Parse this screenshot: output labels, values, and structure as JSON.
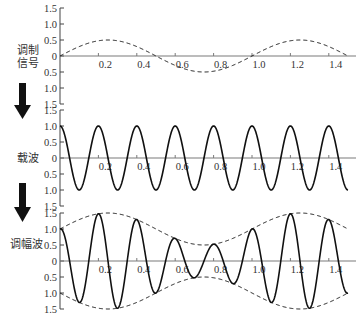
{
  "chart_data": [
    {
      "type": "line",
      "panel": "modulating-signal",
      "side_label": "调制信号",
      "side_label_lines": [
        "调制",
        "信号"
      ],
      "function": "0.5*sin(2*pi*t)",
      "series": [
        {
          "name": "调制信号",
          "style": "dashed",
          "amplitude": 0.5,
          "frequency": 1.0,
          "phase": "sin",
          "x": [
            0,
            0.25,
            0.5,
            0.75,
            1.0,
            1.25,
            1.5
          ],
          "values": [
            0,
            0.5,
            0,
            -0.5,
            0,
            0.5,
            0
          ]
        }
      ],
      "xlim": [
        0,
        1.5
      ],
      "ylim": [
        -1.5,
        1.5
      ],
      "x_ticks": [
        "0.2",
        "0.4",
        "0.6",
        "0.8",
        "1.0",
        "1.2",
        "1.4"
      ],
      "y_tick_labels": [
        "1.5",
        "1.0",
        "0.5",
        "0",
        "0.5",
        "1.0",
        "1.5"
      ],
      "grid": false
    },
    {
      "type": "line",
      "panel": "carrier",
      "side_label": "载波",
      "function": "cos(10*pi*t)",
      "series": [
        {
          "name": "载波",
          "style": "solid",
          "amplitude": 1.0,
          "frequency": 5.0,
          "phase": "cos",
          "x": [
            0,
            0.1,
            0.2,
            0.3,
            0.4,
            0.5,
            0.6,
            0.7,
            0.8,
            0.9,
            1.0,
            1.1,
            1.2,
            1.3,
            1.4,
            1.5
          ],
          "values": [
            1,
            -1,
            1,
            -1,
            1,
            -1,
            1,
            -1,
            1,
            -1,
            1,
            -1,
            1,
            -1,
            1,
            -1
          ]
        }
      ],
      "xlim": [
        0,
        1.5
      ],
      "ylim": [
        -1.5,
        1.5
      ],
      "x_ticks": [
        "0.2",
        "0.4",
        "0.6",
        "0.8",
        "1.0",
        "1.2",
        "1.4"
      ],
      "y_tick_labels": [
        "1.5",
        "1.0",
        "0.5",
        "0",
        "0.5",
        "1.0",
        "1.5"
      ],
      "grid": false
    },
    {
      "type": "line",
      "panel": "am-wave",
      "side_label": "调幅波",
      "function": "(1+0.5*sin(2*pi*t))*cos(10*pi*t)",
      "series": [
        {
          "name": "调幅波",
          "style": "solid",
          "carrier_frequency": 5.0,
          "mod_index": 0.5,
          "mod_frequency": 1.0,
          "x": [
            0,
            0.1,
            0.2,
            0.3,
            0.4,
            0.5,
            0.6,
            0.7,
            0.8,
            0.9,
            1.0,
            1.1,
            1.2,
            1.3,
            1.4,
            1.5
          ],
          "values": [
            1.0,
            -1.29,
            1.48,
            -1.4,
            1.29,
            -1.0,
            0.71,
            -0.52,
            0.52,
            -0.71,
            1.0,
            -1.29,
            1.48,
            -1.4,
            1.29,
            -1.0
          ]
        },
        {
          "name": "上包络",
          "style": "dashed",
          "function": "1+0.5*sin(2*pi*t)",
          "x": [
            0,
            0.25,
            0.5,
            0.75,
            1.0,
            1.25,
            1.5
          ],
          "values": [
            1.0,
            1.5,
            1.0,
            0.5,
            1.0,
            1.5,
            1.0
          ]
        },
        {
          "name": "下包络",
          "style": "dashed",
          "function": "-(1+0.5*sin(2*pi*t))",
          "x": [
            0,
            0.25,
            0.5,
            0.75,
            1.0,
            1.25,
            1.5
          ],
          "values": [
            -1.0,
            -1.5,
            -1.0,
            -0.5,
            -1.0,
            -1.5,
            -1.0
          ]
        }
      ],
      "xlim": [
        0,
        1.5
      ],
      "ylim": [
        -1.5,
        1.5
      ],
      "x_ticks": [
        "0.2",
        "0.4",
        "0.6",
        "0.8",
        "1.0",
        "1.2",
        "1.4"
      ],
      "y_tick_labels": [
        "1.5",
        "1.0",
        "0.5",
        "0",
        "0.5",
        "1.0",
        "1.5"
      ],
      "grid": false
    }
  ],
  "labels": {
    "modulating_line1": "调制",
    "modulating_line2": "信号",
    "carrier": "载波",
    "am_wave": "调幅波"
  },
  "arrows": [
    {
      "from": "调制信号",
      "to": "载波",
      "direction": "down"
    },
    {
      "from": "载波",
      "to": "调幅波",
      "direction": "down"
    }
  ],
  "colors": {
    "curve": "#111111",
    "axis": "#7a7a7a",
    "spine": "#444444",
    "text": "#333333",
    "arrow": "#111111"
  }
}
